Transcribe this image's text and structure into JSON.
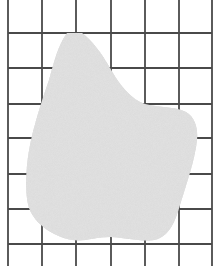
{
  "figure": {
    "grid": {
      "columns": 6,
      "rows_full": 6,
      "vertical_lines_x": [
        8,
        42,
        76,
        111,
        145,
        179,
        212
      ],
      "horizontal_lines_y": [
        33,
        68,
        104,
        138,
        174,
        209,
        244
      ],
      "line_color": "#4a4a4a"
    },
    "shape": {
      "fill_color": "#e2e2e2",
      "stroke_color": "#555555"
    },
    "background_color": "#ffffff"
  }
}
